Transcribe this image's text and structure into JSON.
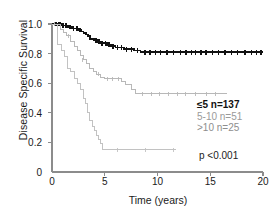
{
  "axes": {
    "ylabel": "Disease Specific Survival",
    "xlabel": "Time (years)",
    "yticks": [
      "0",
      "0.2",
      "0.4",
      "0.6",
      "0.8",
      "1.0"
    ],
    "xticks": [
      "0",
      "5",
      "10",
      "15",
      "20"
    ]
  },
  "legend": {
    "rows": [
      {
        "label": "≤5 n=137",
        "color": "#111111"
      },
      {
        "label": "5-10 n=51",
        "color": "#9a9a9a"
      },
      {
        "label": ">10 n=25",
        "color": "#8e8e8e"
      }
    ]
  },
  "stats": {
    "pvalue": "p <0.001"
  },
  "chart_data": {
    "type": "line",
    "title": "",
    "xlabel": "Time (years)",
    "ylabel": "Disease Specific Survival",
    "xlim": [
      0,
      20
    ],
    "ylim": [
      0,
      1.0
    ],
    "xticks": [
      0,
      5,
      10,
      15,
      20
    ],
    "yticks": [
      0,
      0.2,
      0.4,
      0.6,
      0.8,
      1.0
    ],
    "grid": false,
    "legend_position": "inside-right",
    "annotations": [
      "p <0.001"
    ],
    "series": [
      {
        "name": "≤5 n=137",
        "color": "#111111",
        "n": 137,
        "style": "step",
        "plateau": 0.81,
        "last_time": 20.0,
        "steps": [
          [
            0.0,
            1.0
          ],
          [
            0.7,
            1.0
          ],
          [
            0.9,
            0.99
          ],
          [
            1.2,
            0.99
          ],
          [
            1.5,
            0.98
          ],
          [
            1.9,
            0.97
          ],
          [
            2.2,
            0.97
          ],
          [
            2.5,
            0.96
          ],
          [
            2.8,
            0.95
          ],
          [
            3.0,
            0.94
          ],
          [
            3.2,
            0.93
          ],
          [
            3.4,
            0.92
          ],
          [
            3.6,
            0.9
          ],
          [
            3.8,
            0.9
          ],
          [
            4.0,
            0.89
          ],
          [
            4.3,
            0.88
          ],
          [
            4.6,
            0.87
          ],
          [
            4.9,
            0.87
          ],
          [
            5.2,
            0.86
          ],
          [
            5.6,
            0.85
          ],
          [
            6.0,
            0.84
          ],
          [
            6.4,
            0.84
          ],
          [
            6.8,
            0.83
          ],
          [
            7.3,
            0.83
          ],
          [
            7.8,
            0.82
          ],
          [
            8.4,
            0.81
          ],
          [
            20.0,
            0.81
          ]
        ],
        "censors": [
          [
            0.3,
            1.0
          ],
          [
            0.45,
            1.0
          ],
          [
            0.6,
            1.0
          ],
          [
            0.75,
            1.0
          ],
          [
            1.05,
            0.99
          ],
          [
            1.35,
            0.99
          ],
          [
            1.7,
            0.98
          ],
          [
            2.05,
            0.97
          ],
          [
            2.35,
            0.97
          ],
          [
            2.65,
            0.96
          ],
          [
            4.15,
            0.89
          ],
          [
            4.45,
            0.88
          ],
          [
            4.75,
            0.87
          ],
          [
            5.05,
            0.87
          ],
          [
            5.4,
            0.86
          ],
          [
            5.8,
            0.85
          ],
          [
            6.2,
            0.84
          ],
          [
            6.6,
            0.84
          ],
          [
            7.05,
            0.83
          ],
          [
            7.55,
            0.83
          ],
          [
            8.1,
            0.82
          ],
          [
            8.8,
            0.81
          ],
          [
            9.3,
            0.81
          ],
          [
            9.8,
            0.81
          ],
          [
            10.3,
            0.81
          ],
          [
            10.9,
            0.81
          ],
          [
            11.5,
            0.81
          ],
          [
            12.2,
            0.81
          ],
          [
            12.7,
            0.81
          ],
          [
            13.2,
            0.81
          ],
          [
            13.6,
            0.81
          ],
          [
            14.1,
            0.81
          ],
          [
            14.6,
            0.81
          ],
          [
            15.2,
            0.81
          ],
          [
            15.8,
            0.81
          ],
          [
            16.4,
            0.81
          ],
          [
            17.0,
            0.81
          ],
          [
            17.6,
            0.81
          ],
          [
            18.3,
            0.81
          ],
          [
            18.9,
            0.81
          ],
          [
            19.4,
            0.81
          ],
          [
            19.8,
            0.81
          ]
        ]
      },
      {
        "name": "5-10 n=51",
        "color": "#b8b8b8",
        "n": 51,
        "style": "step",
        "plateau": 0.53,
        "last_time": 16.6,
        "steps": [
          [
            0.0,
            1.0
          ],
          [
            0.5,
            1.0
          ],
          [
            0.8,
            0.96
          ],
          [
            1.1,
            0.94
          ],
          [
            1.4,
            0.92
          ],
          [
            1.8,
            0.88
          ],
          [
            2.1,
            0.85
          ],
          [
            2.4,
            0.82
          ],
          [
            2.7,
            0.79
          ],
          [
            3.0,
            0.76
          ],
          [
            3.3,
            0.73
          ],
          [
            3.6,
            0.7
          ],
          [
            3.9,
            0.68
          ],
          [
            4.2,
            0.66
          ],
          [
            4.6,
            0.64
          ],
          [
            5.0,
            0.63
          ],
          [
            6.0,
            0.63
          ],
          [
            6.6,
            0.61
          ],
          [
            7.0,
            0.59
          ],
          [
            7.5,
            0.56
          ],
          [
            7.9,
            0.53
          ],
          [
            16.6,
            0.53
          ]
        ],
        "censors": [
          [
            0.25,
            1.0
          ],
          [
            1.6,
            0.92
          ],
          [
            2.9,
            0.76
          ],
          [
            4.4,
            0.66
          ],
          [
            5.3,
            0.63
          ],
          [
            5.7,
            0.63
          ],
          [
            6.3,
            0.63
          ],
          [
            8.6,
            0.53
          ],
          [
            9.4,
            0.53
          ],
          [
            10.2,
            0.53
          ],
          [
            11.0,
            0.53
          ],
          [
            11.9,
            0.53
          ],
          [
            12.7,
            0.53
          ],
          [
            13.6,
            0.53
          ],
          [
            14.6,
            0.53
          ],
          [
            15.5,
            0.53
          ]
        ]
      },
      {
        "name": ">10 n=25",
        "color": "#c2c2c2",
        "n": 25,
        "style": "step",
        "plateau": 0.15,
        "last_time": 11.8,
        "steps": [
          [
            0.0,
            1.0
          ],
          [
            0.35,
            1.0
          ],
          [
            0.5,
            0.86
          ],
          [
            0.9,
            0.82
          ],
          [
            1.2,
            0.78
          ],
          [
            1.5,
            0.7
          ],
          [
            1.8,
            0.68
          ],
          [
            2.1,
            0.63
          ],
          [
            2.4,
            0.6
          ],
          [
            2.7,
            0.56
          ],
          [
            3.0,
            0.5
          ],
          [
            3.2,
            0.46
          ],
          [
            3.4,
            0.4
          ],
          [
            3.6,
            0.35
          ],
          [
            3.8,
            0.31
          ],
          [
            4.0,
            0.28
          ],
          [
            4.2,
            0.25
          ],
          [
            4.4,
            0.22
          ],
          [
            4.6,
            0.19
          ],
          [
            4.8,
            0.15
          ],
          [
            11.8,
            0.15
          ]
        ],
        "censors": [
          [
            6.2,
            0.15
          ],
          [
            8.9,
            0.15
          ],
          [
            11.5,
            0.15
          ]
        ]
      }
    ]
  }
}
